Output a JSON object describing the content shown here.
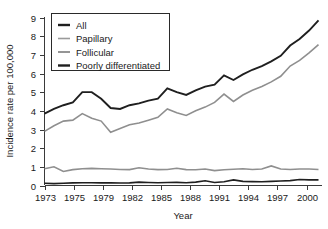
{
  "chart_data": {
    "type": "line",
    "title": "",
    "xlabel": "Year",
    "ylabel": "Incidence rate per 100,000",
    "xlim": [
      1973,
      2002
    ],
    "ylim": [
      0,
      9
    ],
    "grid": false,
    "legend_position": "top-left",
    "x": [
      1973,
      1974,
      1975,
      1976,
      1977,
      1978,
      1979,
      1980,
      1981,
      1982,
      1983,
      1984,
      1985,
      1986,
      1987,
      1988,
      1989,
      1990,
      1991,
      1992,
      1993,
      1994,
      1995,
      1996,
      1997,
      1998,
      1999,
      2000,
      2001,
      2002
    ],
    "xticks": [
      1973,
      1975,
      1979,
      1982,
      1985,
      1988,
      1991,
      1994,
      1997,
      2000
    ],
    "xtick_labels": [
      "1973",
      "1975",
      "1979",
      "1982",
      "1985",
      "1988",
      "1991",
      "1994",
      "1997",
      "2000"
    ],
    "yticks": [
      0,
      1,
      2,
      3,
      4,
      5,
      6,
      7,
      8,
      9
    ],
    "ytick_labels": [
      "0",
      "1",
      "2",
      "3",
      "4",
      "5",
      "6",
      "7",
      "8",
      "9"
    ],
    "series": [
      {
        "name": "All",
        "color": "#1f1f1f",
        "width": 1.9,
        "values": [
          3.85,
          4.1,
          4.3,
          4.45,
          5.0,
          5.0,
          4.65,
          4.15,
          4.1,
          4.3,
          4.4,
          4.55,
          4.65,
          5.2,
          5.0,
          4.85,
          5.1,
          5.3,
          5.4,
          5.9,
          5.65,
          5.95,
          6.2,
          6.4,
          6.65,
          6.95,
          7.5,
          7.85,
          8.3,
          8.85
        ]
      },
      {
        "name": "Papillary",
        "color": "#8f8f8f",
        "width": 1.6,
        "values": [
          2.9,
          3.2,
          3.45,
          3.5,
          3.85,
          3.6,
          3.45,
          2.85,
          3.05,
          3.25,
          3.35,
          3.5,
          3.65,
          4.1,
          3.9,
          3.75,
          4.0,
          4.2,
          4.45,
          4.9,
          4.5,
          4.85,
          5.1,
          5.3,
          5.55,
          5.85,
          6.4,
          6.7,
          7.1,
          7.55
        ]
      },
      {
        "name": "Follicular",
        "color": "#8f8f8f",
        "width": 1.6,
        "values": [
          0.9,
          1.0,
          0.75,
          0.85,
          0.9,
          0.92,
          0.9,
          0.88,
          0.86,
          0.85,
          0.95,
          0.88,
          0.85,
          0.86,
          0.92,
          0.85,
          0.84,
          0.88,
          0.8,
          0.84,
          0.87,
          0.9,
          0.86,
          0.88,
          1.05,
          0.88,
          0.86,
          0.88,
          0.88,
          0.86
        ]
      },
      {
        "name": "Poorly differentiated",
        "color": "#1f1f1f",
        "width": 1.6,
        "values": [
          0.12,
          0.1,
          0.12,
          0.14,
          0.15,
          0.15,
          0.14,
          0.15,
          0.13,
          0.14,
          0.18,
          0.16,
          0.15,
          0.16,
          0.17,
          0.15,
          0.18,
          0.25,
          0.16,
          0.2,
          0.3,
          0.22,
          0.21,
          0.2,
          0.22,
          0.24,
          0.26,
          0.32,
          0.3,
          0.3
        ]
      }
    ],
    "legend": [
      {
        "label": "All",
        "color": "#1f1f1f",
        "width": 2.4
      },
      {
        "label": "Papillary",
        "color": "#9a9a9a",
        "width": 1.6
      },
      {
        "label": "Follicular",
        "color": "#8a8a8a",
        "width": 1.8
      },
      {
        "label": "Poorly differentiated",
        "color": "#1f1f1f",
        "width": 2.4
      }
    ]
  }
}
